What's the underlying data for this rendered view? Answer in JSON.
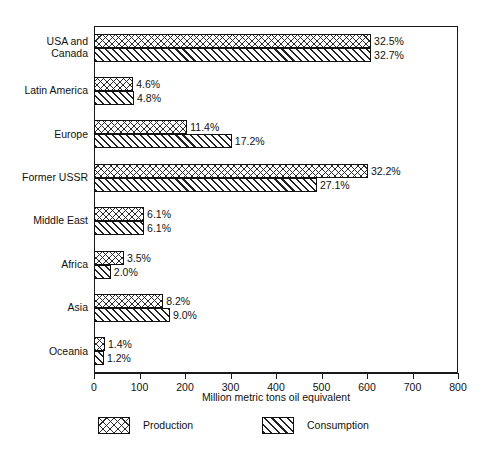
{
  "chart_data": {
    "type": "bar",
    "orientation": "horizontal",
    "title": "",
    "xlabel": "Million metric tons oil equivalent",
    "ylabel": "",
    "xlim": [
      0,
      800
    ],
    "xticks": [
      0,
      100,
      200,
      300,
      400,
      500,
      600,
      700,
      800
    ],
    "grid": false,
    "legend_position": "bottom",
    "categories": [
      "USA and\nCanada",
      "Latin America",
      "Europe",
      "Former USSR",
      "Middle East",
      "Africa",
      "Asia",
      "Oceania"
    ],
    "series": [
      {
        "name": "Production",
        "pattern": "cross-hatch",
        "values": [
          609,
          86,
          205,
          602,
          110,
          66,
          152,
          24
        ],
        "labels": [
          "32.5%",
          "4.6%",
          "11.4%",
          "32.2%",
          "6.1%",
          "3.5%",
          "8.2%",
          "1.4%"
        ]
      },
      {
        "name": "Consumption",
        "pattern": "diagonal-hatch",
        "values": [
          609,
          88,
          303,
          490,
          110,
          37,
          167,
          22
        ],
        "labels": [
          "32.7%",
          "4.8%",
          "17.2%",
          "27.1%",
          "6.1%",
          "2.0%",
          "9.0%",
          "1.2%"
        ]
      }
    ]
  },
  "legend": {
    "items": [
      {
        "label": "Production"
      },
      {
        "label": "Consumption"
      }
    ]
  },
  "axis": {
    "x_title": "Million metric tons oil equivalent",
    "tick_labels": [
      "0",
      "100",
      "200",
      "300",
      "400",
      "500",
      "600",
      "700",
      "800"
    ]
  },
  "colors": {
    "ink": "#1a1a1a",
    "hatch": "#222222",
    "background": "#ffffff"
  }
}
